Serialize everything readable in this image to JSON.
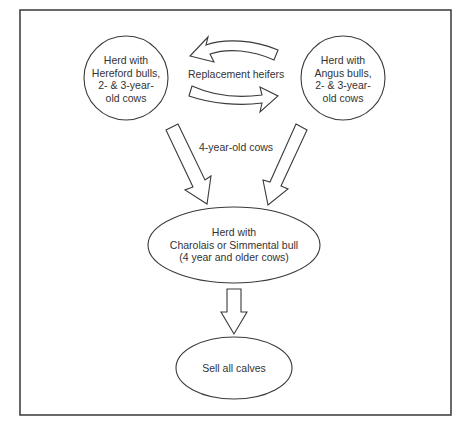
{
  "diagram": {
    "type": "flowchart",
    "nodes": [
      {
        "id": "hereford",
        "shape": "circle",
        "lines": [
          "Herd with",
          "Hereford bulls,",
          "2- & 3-year-",
          "old cows"
        ]
      },
      {
        "id": "angus",
        "shape": "circle",
        "lines": [
          "Herd with",
          "Angus bulls,",
          "2- & 3-year-",
          "old cows"
        ]
      },
      {
        "id": "terminal",
        "shape": "ellipse",
        "lines": [
          "Herd with",
          "Charolais or Simmental bull",
          "(4 year and older cows)"
        ]
      },
      {
        "id": "sell",
        "shape": "ellipse",
        "lines": [
          "Sell all calves"
        ]
      }
    ],
    "edges": [
      {
        "from": "angus",
        "to": "hereford",
        "label": "Replacement heifers"
      },
      {
        "from": "hereford",
        "to": "angus",
        "label": "Replacement heifers"
      },
      {
        "from": "hereford",
        "to": "terminal",
        "label": "4-year-old cows"
      },
      {
        "from": "angus",
        "to": "terminal",
        "label": "4-year-old cows"
      },
      {
        "from": "terminal",
        "to": "sell",
        "label": ""
      }
    ],
    "labels": {
      "replacement": "Replacement heifers",
      "four_year": "4-year-old cows"
    }
  }
}
